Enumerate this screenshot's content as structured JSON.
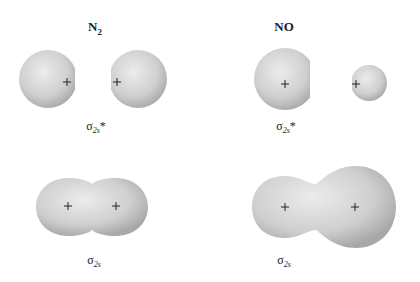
{
  "columns": [
    {
      "molecule": "N",
      "molecule_subscript": "2",
      "orbitals": [
        {
          "name": "sigma-2s-antibonding",
          "label_symbol": "σ",
          "label_subscript": "2s",
          "label_superscript": "*"
        },
        {
          "name": "sigma-2s-bonding",
          "label_symbol": "σ",
          "label_subscript": "2s",
          "label_superscript": ""
        }
      ]
    },
    {
      "molecule": "NO",
      "molecule_subscript": "",
      "orbitals": [
        {
          "name": "sigma-2s-antibonding",
          "label_symbol": "σ",
          "label_subscript": "2s",
          "label_superscript": "*"
        },
        {
          "name": "sigma-2s-bonding",
          "label_symbol": "σ",
          "label_subscript": "2s",
          "label_superscript": ""
        }
      ]
    }
  ],
  "nucleus_marker": "+",
  "colors": {
    "lobe_light": "#e9e9e9",
    "lobe_dark": "#a9a9a9",
    "marker": "#222222"
  }
}
